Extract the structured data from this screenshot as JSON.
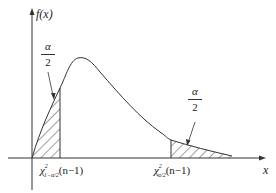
{
  "figure": {
    "type": "chi-square density with two-tailed critical regions",
    "y_axis_label": "f(x)",
    "x_axis_label": "x",
    "left_tail": {
      "area_label_num": "α",
      "area_label_den": "2",
      "critical_value_label": "χ²₁₋α/₂(n−1)",
      "chi_symbol": "χ",
      "sup": "2",
      "sub": "1−α/2",
      "arg": "(n−1)"
    },
    "right_tail": {
      "area_label_num": "α",
      "area_label_den": "2",
      "critical_value_label": "χ²α/₂(n−1)",
      "chi_symbol": "χ",
      "sup": "2",
      "sub": "α/2",
      "arg": "(n−1)"
    },
    "colors": {
      "line": "#333333",
      "background": "#ffffff"
    }
  }
}
